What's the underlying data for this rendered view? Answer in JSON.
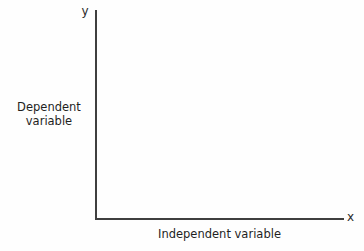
{
  "chart_data": {
    "type": "scatter",
    "title": "",
    "subtitle": "",
    "xlabel": "Independent variable",
    "ylabel": "Dependent variable",
    "ylabel_lines": [
      "Dependent",
      "variable"
    ],
    "x_axis_symbol": "x",
    "y_axis_symbol": "y",
    "categories": [],
    "x": [],
    "values": [],
    "series": [],
    "annotations": [],
    "legend": [],
    "legend_position": "none",
    "grid": false,
    "xlim": [
      0,
      0
    ],
    "ylim": [
      0,
      0
    ],
    "xticks": [],
    "yticks": [],
    "xtick_labels": [],
    "ytick_labels": [],
    "note": "Empty labelled coordinate axes; no data plotted."
  },
  "figure": {
    "background_color": "#fefefe",
    "axis_color": "#3f3f3f",
    "text_color": "#1f1f1f"
  }
}
